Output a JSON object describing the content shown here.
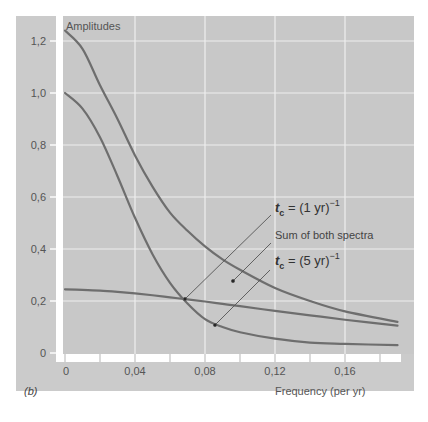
{
  "chart_data": {
    "type": "line",
    "panel_label": "(b)",
    "title": "",
    "ylabel": "Amplitudes",
    "xlabel": "Frequency (per yr)",
    "xlim": [
      0,
      0.19
    ],
    "ylim": [
      0,
      1.25
    ],
    "grid": true,
    "x_ticks": [
      0,
      0.04,
      0.08,
      0.12,
      0.16
    ],
    "x_tick_labels": [
      "0",
      "0,04",
      "0,08",
      "0,12",
      "0,16"
    ],
    "x_minor_ticks": [
      0.02,
      0.06,
      0.1,
      0.14,
      0.18
    ],
    "y_ticks": [
      0,
      0.2,
      0.4,
      0.6,
      0.8,
      1.0,
      1.2
    ],
    "y_tick_labels": [
      "0",
      "0,2",
      "0,4",
      "0,6",
      "0,8",
      "1,0",
      "1,2"
    ],
    "x": [
      0,
      0.01,
      0.02,
      0.03,
      0.04,
      0.05,
      0.06,
      0.07,
      0.08,
      0.09,
      0.1,
      0.12,
      0.14,
      0.16,
      0.19
    ],
    "series": [
      {
        "name": "Sum of both spectra",
        "values": [
          1.24,
          1.17,
          1.03,
          0.9,
          0.76,
          0.64,
          0.54,
          0.47,
          0.41,
          0.36,
          0.32,
          0.25,
          0.2,
          0.16,
          0.12
        ]
      },
      {
        "name": "t_c = (1 yr)^-1",
        "values": [
          1.0,
          0.94,
          0.83,
          0.68,
          0.52,
          0.38,
          0.27,
          0.19,
          0.13,
          0.1,
          0.08,
          0.055,
          0.04,
          0.035,
          0.03
        ]
      },
      {
        "name": "t_c = (5 yr)^-1",
        "values": [
          0.245,
          0.243,
          0.24,
          0.235,
          0.229,
          0.222,
          0.214,
          0.206,
          0.198,
          0.189,
          0.18,
          0.162,
          0.145,
          0.128,
          0.105
        ]
      }
    ],
    "annotations": [
      {
        "text": "t_c = (1 yr)^-1",
        "display_main": "t",
        "display_sub": "c",
        "display_rest": " = (1 yr)",
        "display_sup": "−1"
      },
      {
        "text": "Sum of both spectra"
      },
      {
        "text": "t_c = (5 yr)^-1",
        "display_main": "t",
        "display_sub": "c",
        "display_rest": " = (5 yr)",
        "display_sup": "−1"
      }
    ]
  },
  "colors": {
    "panel_bg": "#cbcbcb",
    "plot_bg": "#c7c7c7",
    "grid": "#eeeeee",
    "axis_strip": "#ffffff",
    "curve": "#6e6e6e",
    "leader": "#555555",
    "text": "#555555"
  }
}
